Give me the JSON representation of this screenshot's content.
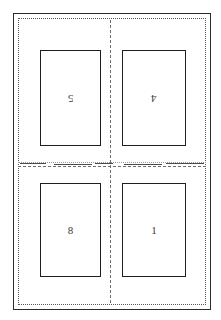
{
  "document": {
    "type": "imposition-layout-sheet",
    "orientation": "portrait",
    "width_px": 221,
    "height_px": 320
  },
  "frames": {
    "outer_trim_label": "",
    "inner_margin_label": ""
  },
  "guides": {
    "vertical_center_style": "dashed",
    "horizontal_center_style": "dashed"
  },
  "colors": {
    "trim_line": "#2b2b2b",
    "margin_line": "#555555",
    "fold_line": "#6d6d6d",
    "panel_border": "#1f1f1f",
    "label_text": "#3a3a3a",
    "page_background": "#ffffff"
  },
  "panels": [
    {
      "position": "top-left",
      "label": "5",
      "rotated": true
    },
    {
      "position": "top-right",
      "label": "4",
      "rotated": true
    },
    {
      "position": "bottom-left",
      "label": "8",
      "rotated": false
    },
    {
      "position": "bottom-right",
      "label": "1",
      "rotated": false
    }
  ]
}
